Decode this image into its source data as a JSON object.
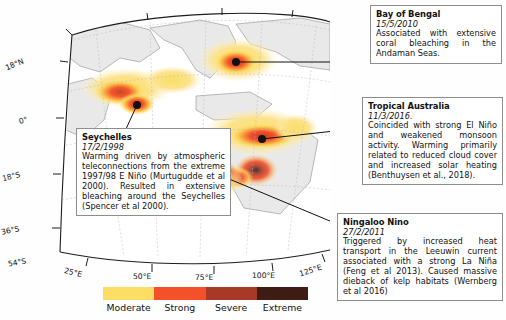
{
  "figure": {
    "type": "annotated-map",
    "region": "Indian Ocean"
  },
  "map": {
    "projection": "conic",
    "latitude_ticks": [
      "18°N",
      "0°",
      "18°S",
      "36°S",
      "54°S"
    ],
    "longitude_ticks": [
      "25°E",
      "50°E",
      "75°E",
      "100°E",
      "125°E"
    ],
    "land_fill": "#e8e8e8",
    "ocean_fill": "#ffffff",
    "graticule_color": "#b9b9c4"
  },
  "legend": {
    "categories": [
      {
        "label": "Moderate",
        "color": "#FBDE63"
      },
      {
        "label": "Strong",
        "color": "#F4502A"
      },
      {
        "label": "Severe",
        "color": "#A63A27"
      },
      {
        "label": "Extreme",
        "color": "#3D1C14"
      }
    ]
  },
  "events": [
    {
      "id": "bay-of-bengal",
      "title": "Bay of Bengal",
      "date": "15/5/2010",
      "body": "Associated with extensive coral bleaching in the Andaman Seas."
    },
    {
      "id": "tropical-australia",
      "title": "Tropical Australia",
      "date": "11/3/2016.",
      "body": "Coincided with strong El Niño and weakened monsoon activity. Warming primarily related to reduced cloud cover and increased solar heating (Benthuysen et al., 2018)."
    },
    {
      "id": "ningaloo-nino",
      "title": "Ningaloo Nino",
      "date": "27/2/2011",
      "body": "Triggered by increased heat transport in the Leeuwin current associated with a strong La Niña (Feng et al 2013). Caused massive dieback of kelp habitats (Wernberg et al 2016)"
    },
    {
      "id": "seychelles",
      "title": "Seychelles",
      "date": "17/2/1998",
      "body": "Warming driven by atmospheric teleconnections from the extreme 1997/98 E Niño (Murtugudde et al 2000). Resulted in extensive bleaching around the Seychelles (Spencer et al 2000)."
    }
  ]
}
